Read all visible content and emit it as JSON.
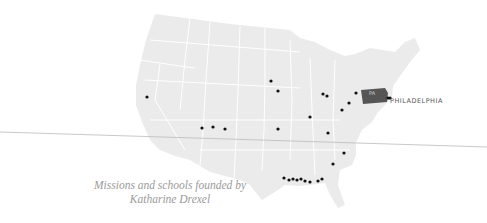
{
  "caption": {
    "line1": "Missions and schools founded by",
    "line2": "Katharine Drexel"
  },
  "highlight_state": {
    "abbr": "PA",
    "color": "#555555"
  },
  "city": {
    "label": "PHILADELPHIA"
  },
  "colors": {
    "land": "#ebebeb",
    "borders": "#ffffff",
    "marker": "#111111",
    "line": "#bbbbbb",
    "caption": "#9a9a9a"
  },
  "markers": [
    {
      "x": 147,
      "y": 97
    },
    {
      "x": 271,
      "y": 81
    },
    {
      "x": 278,
      "y": 91
    },
    {
      "x": 323,
      "y": 94
    },
    {
      "x": 327,
      "y": 96
    },
    {
      "x": 356,
      "y": 93
    },
    {
      "x": 349,
      "y": 103
    },
    {
      "x": 342,
      "y": 110
    },
    {
      "x": 310,
      "y": 117
    },
    {
      "x": 278,
      "y": 129
    },
    {
      "x": 328,
      "y": 133
    },
    {
      "x": 202,
      "y": 128
    },
    {
      "x": 213,
      "y": 127
    },
    {
      "x": 225,
      "y": 129
    },
    {
      "x": 344,
      "y": 153
    },
    {
      "x": 333,
      "y": 164
    },
    {
      "x": 284,
      "y": 178
    },
    {
      "x": 289,
      "y": 180
    },
    {
      "x": 293,
      "y": 179
    },
    {
      "x": 297,
      "y": 180
    },
    {
      "x": 301,
      "y": 179
    },
    {
      "x": 305,
      "y": 181
    },
    {
      "x": 310,
      "y": 182
    },
    {
      "x": 318,
      "y": 181
    },
    {
      "x": 322,
      "y": 179
    },
    {
      "x": 388,
      "y": 98
    },
    {
      "x": 390,
      "y": 98
    }
  ]
}
